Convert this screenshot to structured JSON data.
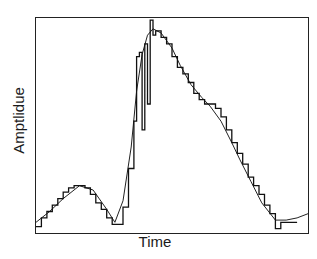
{
  "chart_data": {
    "type": "line",
    "title": "",
    "xlabel": "Time",
    "ylabel": "Amptlidue",
    "xlim": [
      0,
      100
    ],
    "ylim": [
      0,
      100
    ],
    "grid": false,
    "legend": null,
    "ticks": {
      "x": [],
      "y": []
    },
    "series": [
      {
        "name": "smooth",
        "style": "thin-line",
        "x": [
          0,
          5,
          10,
          16,
          21,
          26,
          29,
          32,
          35,
          37,
          39,
          41,
          43,
          46,
          50,
          53,
          57,
          61,
          64,
          68,
          72,
          75,
          79,
          83,
          88,
          92,
          96,
          100
        ],
        "y": [
          5,
          10,
          16,
          22,
          20,
          11,
          5,
          15,
          40,
          66,
          83,
          92,
          95,
          93,
          86,
          78,
          69,
          63,
          59,
          52,
          42,
          34,
          24,
          14,
          6,
          6,
          7,
          9
        ]
      },
      {
        "name": "quantized",
        "style": "stepped",
        "x": [
          0,
          2,
          4,
          6,
          8,
          10,
          12,
          14,
          16,
          18,
          20,
          22,
          24,
          26,
          28,
          30,
          32,
          34,
          36,
          37,
          38,
          39,
          40,
          41,
          42,
          43,
          44,
          46,
          48,
          50,
          52,
          54,
          56,
          58,
          60,
          62,
          64,
          66,
          68,
          70,
          72,
          74,
          76,
          78,
          80,
          82,
          84,
          86,
          88,
          90,
          92,
          94
        ],
        "y": [
          3,
          7,
          10,
          13,
          16,
          19,
          21,
          22,
          22,
          21,
          18,
          14,
          11,
          7,
          4,
          4,
          12,
          30,
          52,
          82,
          84,
          48,
          88,
          60,
          99,
          92,
          94,
          91,
          88,
          82,
          77,
          74,
          70,
          65,
          62,
          60,
          60,
          58,
          54,
          48,
          42,
          37,
          32,
          26,
          22,
          18,
          13,
          9,
          2,
          5,
          5,
          5
        ]
      }
    ]
  }
}
